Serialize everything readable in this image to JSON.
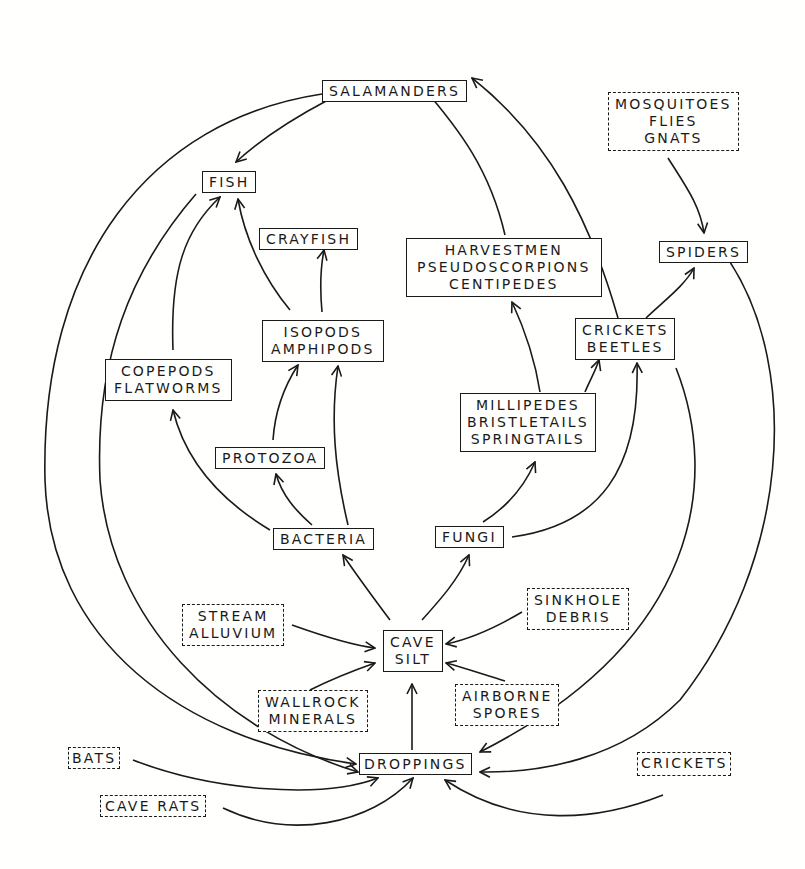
{
  "diagram": {
    "legend_note": "Solid boxes = cave organisms/materials; dashed boxes = external sources",
    "nodes": {
      "salamanders": {
        "lines": [
          "SALAMANDERS"
        ],
        "style": "solid"
      },
      "mosquitoes": {
        "lines": [
          "MOSQUITOES",
          "FLIES",
          "GNATS"
        ],
        "style": "dashed"
      },
      "fish": {
        "lines": [
          "FISH"
        ],
        "style": "solid"
      },
      "crayfish": {
        "lines": [
          "CRAYFISH"
        ],
        "style": "solid"
      },
      "harvestmen": {
        "lines": [
          "HARVESTMEN",
          "PSEUDOSCORPIONS",
          "CENTIPEDES"
        ],
        "style": "solid"
      },
      "spiders": {
        "lines": [
          "SPIDERS"
        ],
        "style": "solid"
      },
      "isopods": {
        "lines": [
          "ISOPODS",
          "AMPHIPODS"
        ],
        "style": "solid"
      },
      "crickets_beetles": {
        "lines": [
          "CRICKETS",
          "BEETLES"
        ],
        "style": "solid"
      },
      "copepods": {
        "lines": [
          "COPEPODS",
          "FLATWORMS"
        ],
        "style": "solid"
      },
      "millipedes": {
        "lines": [
          "MILLIPEDES",
          "BRISTLETAILS",
          "SPRINGTAILS"
        ],
        "style": "solid"
      },
      "protozoa": {
        "lines": [
          "PROTOZOA"
        ],
        "style": "solid"
      },
      "bacteria": {
        "lines": [
          "BACTERIA"
        ],
        "style": "solid"
      },
      "fungi": {
        "lines": [
          "FUNGI"
        ],
        "style": "solid"
      },
      "stream": {
        "lines": [
          "STREAM",
          "ALLUVIUM"
        ],
        "style": "dashed"
      },
      "sinkhole": {
        "lines": [
          "SINKHOLE",
          "DEBRIS"
        ],
        "style": "dashed"
      },
      "cave_silt": {
        "lines": [
          "CAVE",
          "SILT"
        ],
        "style": "solid"
      },
      "wallrock": {
        "lines": [
          "WALLROCK",
          "MINERALS"
        ],
        "style": "dashed"
      },
      "airborne": {
        "lines": [
          "AIRBORNE",
          "SPORES"
        ],
        "style": "dashed"
      },
      "bats": {
        "lines": [
          "BATS"
        ],
        "style": "dashed"
      },
      "droppings": {
        "lines": [
          "DROPPINGS"
        ],
        "style": "solid"
      },
      "crickets_ext": {
        "lines": [
          "CRICKETS"
        ],
        "style": "dashed"
      },
      "cave_rats": {
        "lines": [
          "CAVE RATS"
        ],
        "style": "dashed"
      }
    },
    "edges": [
      {
        "from": "salamanders",
        "to": "fish"
      },
      {
        "from": "harvestmen",
        "to": "salamanders"
      },
      {
        "from": "crickets_beetles",
        "to": "salamanders"
      },
      {
        "from": "mosquitoes",
        "to": "spiders"
      },
      {
        "from": "crickets_beetles",
        "to": "spiders"
      },
      {
        "from": "copepods",
        "to": "fish"
      },
      {
        "from": "isopods",
        "to": "fish"
      },
      {
        "from": "isopods",
        "to": "crayfish"
      },
      {
        "from": "bacteria",
        "to": "copepods"
      },
      {
        "from": "bacteria",
        "to": "protozoa"
      },
      {
        "from": "bacteria",
        "to": "isopods"
      },
      {
        "from": "protozoa",
        "to": "isopods"
      },
      {
        "from": "millipedes",
        "to": "harvestmen"
      },
      {
        "from": "millipedes",
        "to": "crickets_beetles"
      },
      {
        "from": "fungi",
        "to": "millipedes"
      },
      {
        "from": "fungi",
        "to": "crickets_beetles"
      },
      {
        "from": "cave_silt",
        "to": "bacteria"
      },
      {
        "from": "cave_silt",
        "to": "fungi"
      },
      {
        "from": "stream",
        "to": "cave_silt"
      },
      {
        "from": "wallrock",
        "to": "cave_silt"
      },
      {
        "from": "sinkhole",
        "to": "cave_silt"
      },
      {
        "from": "airborne",
        "to": "cave_silt"
      },
      {
        "from": "droppings",
        "to": "cave_silt"
      },
      {
        "from": "salamanders",
        "to": "droppings"
      },
      {
        "from": "fish",
        "to": "droppings"
      },
      {
        "from": "bats",
        "to": "droppings"
      },
      {
        "from": "cave_rats",
        "to": "droppings"
      },
      {
        "from": "crickets_beetles",
        "to": "droppings"
      },
      {
        "from": "spiders",
        "to": "droppings"
      },
      {
        "from": "crickets_ext",
        "to": "droppings"
      }
    ]
  }
}
